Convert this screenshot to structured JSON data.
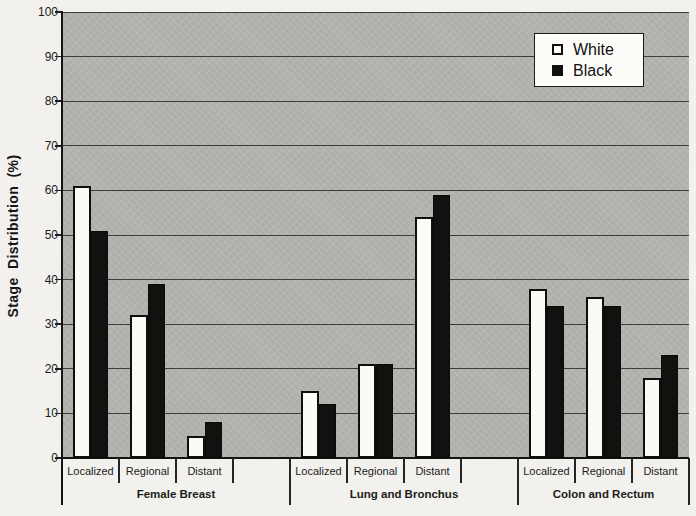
{
  "chart_data": {
    "type": "bar",
    "title": "",
    "ylabel": "Stage Distribution (%)",
    "xlabel": "",
    "ylim": [
      0,
      100
    ],
    "yticks": [
      0,
      10,
      20,
      30,
      40,
      50,
      60,
      70,
      80,
      90,
      100
    ],
    "grid": true,
    "legend": [
      "White",
      "Black"
    ],
    "legend_position": "top-right-inside",
    "plot_bg_color": "#b4b3b0",
    "series_colors": {
      "White": "#ffffff",
      "Black": "#111111"
    },
    "groups": [
      {
        "label": "Female Breast",
        "categories": [
          "Localized",
          "Regional",
          "Distant"
        ],
        "series": [
          {
            "name": "White",
            "values": [
              61,
              32,
              5
            ]
          },
          {
            "name": "Black",
            "values": [
              51,
              39,
              8
            ]
          }
        ]
      },
      {
        "label": "Lung and Bronchus",
        "categories": [
          "Localized",
          "Regional",
          "Distant"
        ],
        "series": [
          {
            "name": "White",
            "values": [
              15,
              21,
              54
            ]
          },
          {
            "name": "Black",
            "values": [
              12,
              21,
              59
            ]
          }
        ]
      },
      {
        "label": "Colon and Rectum",
        "categories": [
          "Localized",
          "Regional",
          "Distant"
        ],
        "series": [
          {
            "name": "White",
            "values": [
              38,
              36,
              18
            ]
          },
          {
            "name": "Black",
            "values": [
              34,
              34,
              23
            ]
          }
        ]
      }
    ]
  }
}
